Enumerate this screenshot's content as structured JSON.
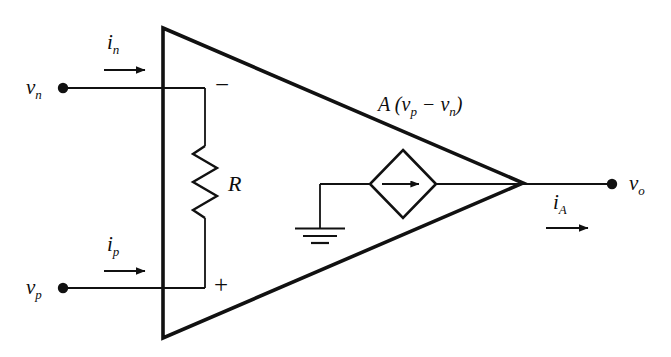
{
  "figure": {
    "kind": "circuit-schematic",
    "background_color": "#ffffff",
    "line_color": "#111111",
    "text_color": "#0d0d0d"
  },
  "labels": {
    "v_n": {
      "base": "v",
      "sub": "n"
    },
    "v_p": {
      "base": "v",
      "sub": "p"
    },
    "v_o": {
      "base": "v",
      "sub": "o"
    },
    "i_n": {
      "base": "i",
      "sub": "n"
    },
    "i_p": {
      "base": "i",
      "sub": "p"
    },
    "i_A": {
      "base": "i",
      "sub": "A"
    },
    "resistor": "R",
    "gain_expression": "A (v",
    "gain_sub_1": "p",
    "gain_minus": " − v",
    "gain_sub_2": "n",
    "gain_close": ")",
    "minus_terminal": "−",
    "plus_terminal": "+"
  },
  "components": [
    {
      "name": "amplifier-triangle",
      "type": "triangle",
      "vertices": "163,28 163,338 523,183"
    },
    {
      "name": "input-resistor",
      "type": "resistor",
      "value_label": "R",
      "orientation": "vertical"
    },
    {
      "name": "dependent-source",
      "type": "diamond-current-source",
      "arrow": "right"
    },
    {
      "name": "ground",
      "type": "earth-ground",
      "bars": 3
    },
    {
      "name": "terminal-vn",
      "type": "node-dot"
    },
    {
      "name": "terminal-vp",
      "type": "node-dot"
    },
    {
      "name": "terminal-vo",
      "type": "node-dot"
    }
  ],
  "currents": [
    {
      "name": "i_n",
      "direction": "right",
      "at": "inverting input"
    },
    {
      "name": "i_p",
      "direction": "right",
      "at": "non-inverting input"
    },
    {
      "name": "i_A",
      "direction": "right",
      "at": "output"
    }
  ]
}
